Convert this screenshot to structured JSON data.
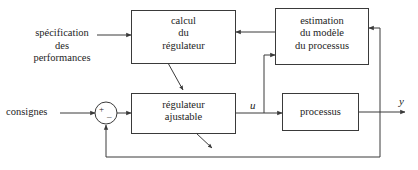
{
  "diagram": {
    "language": "fr",
    "stroke_color": "#3a3a3a",
    "text_color": "#1d1d1d",
    "background_color": "#ffffff"
  },
  "free_text": {
    "specification": "spécification\ndes\nperformances",
    "consignes": "consignes"
  },
  "blocks": {
    "calcul": "calcul\ndu\nrégulateur",
    "estimation": "estimation\ndu modèle\ndu processus",
    "regulateur": "régulateur\najustable",
    "processus": "processus"
  },
  "signals": {
    "u": "u",
    "y": "y"
  },
  "summing_junction": {
    "plus": "+",
    "minus": "_"
  }
}
